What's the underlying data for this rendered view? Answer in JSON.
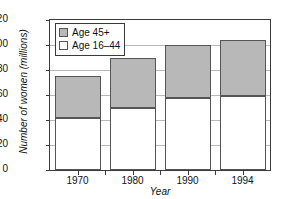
{
  "chart_data": {
    "type": "bar",
    "subtype": "stacked-vertical",
    "title": "",
    "xlabel": "Year",
    "ylabel": "Number of women (millions)",
    "categories": [
      "1970",
      "1980",
      "1990",
      "1994"
    ],
    "series": [
      {
        "name": "Age 16–44",
        "color": "#ffffff",
        "values": [
          42,
          50,
          58,
          59
        ]
      },
      {
        "name": "Age 45+",
        "color": "#b8b8b8",
        "values": [
          33,
          40,
          42,
          45
        ]
      }
    ],
    "totals": [
      75,
      90,
      100,
      104
    ],
    "ylim": [
      0,
      120
    ],
    "yticks": [
      0,
      20,
      40,
      60,
      80,
      100,
      120
    ],
    "ytick_labels": [
      "0",
      "20",
      "40",
      "60",
      "80",
      "100",
      "120"
    ],
    "grid": true,
    "grid_axis": "y",
    "legend_position": "top-left",
    "legend_entries": [
      "Age 45+",
      "Age 16–44"
    ]
  },
  "legend": {
    "items": [
      {
        "label": "Age 45+",
        "swatch": "gray-swatch-icon"
      },
      {
        "label": "Age 16–44",
        "swatch": "white-swatch-icon"
      }
    ]
  },
  "axes": {
    "y_title": "Number of women (millions)",
    "x_title": "Year"
  }
}
